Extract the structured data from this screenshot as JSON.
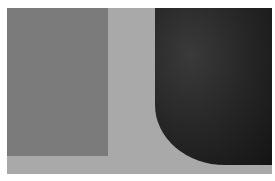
{
  "artwork": {
    "description": "Abstract grayscale composition: medium-gray rectangle on the left, light-gray field, and a dark rounded shape on the right",
    "colors": {
      "background": "#a9a9a9",
      "rectangle": "#7b7b7b",
      "dark_shape": "#1e1e1e",
      "frame": "#ffffff"
    }
  }
}
